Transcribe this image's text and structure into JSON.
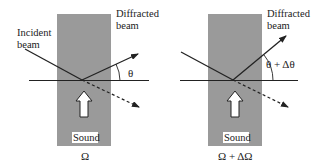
{
  "left_panel": {
    "incident_label_line1": "Incident",
    "incident_label_line2": "beam",
    "diffracted_label_line1": "Diffracted",
    "diffracted_label_line2": "beam",
    "angle_label": "θ",
    "sound_label": "Sound",
    "frequency_label": "Ω"
  },
  "right_panel": {
    "diffracted_label_line1": "Diffracted",
    "diffracted_label_line2": "beam",
    "angle_label": "θ + Δθ",
    "sound_label": "Sound",
    "frequency_label": "Ω + ΔΩ"
  },
  "colors": {
    "medium_fill": "#9a9a9a",
    "line": "#222222",
    "background": "#ffffff"
  }
}
